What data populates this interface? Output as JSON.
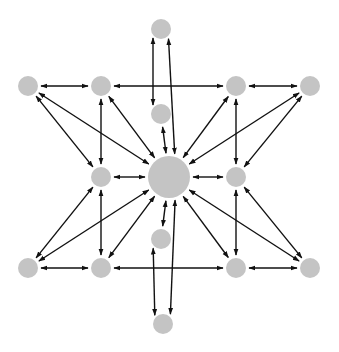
{
  "diagram": {
    "type": "network-star",
    "node_color": "#c4c4c4",
    "edge_color": "#111111",
    "background": "#ffffff",
    "nodes": [
      {
        "id": "center",
        "x": 169,
        "y": 177,
        "r": 21
      },
      {
        "id": "top",
        "x": 161,
        "y": 29,
        "r": 10
      },
      {
        "id": "upper-mid",
        "x": 161,
        "y": 114,
        "r": 10
      },
      {
        "id": "lower-mid",
        "x": 161,
        "y": 239,
        "r": 10
      },
      {
        "id": "bottom",
        "x": 163,
        "y": 324,
        "r": 10
      },
      {
        "id": "inner-top-left",
        "x": 101,
        "y": 86,
        "r": 10
      },
      {
        "id": "inner-mid-left",
        "x": 101,
        "y": 177,
        "r": 10
      },
      {
        "id": "inner-bottom-left",
        "x": 101,
        "y": 268,
        "r": 10
      },
      {
        "id": "inner-top-right",
        "x": 236,
        "y": 86,
        "r": 10
      },
      {
        "id": "inner-mid-right",
        "x": 236,
        "y": 177,
        "r": 10
      },
      {
        "id": "inner-bottom-right",
        "x": 236,
        "y": 268,
        "r": 10
      },
      {
        "id": "outer-top-left",
        "x": 28,
        "y": 86,
        "r": 10
      },
      {
        "id": "outer-bottom-left",
        "x": 28,
        "y": 268,
        "r": 10
      },
      {
        "id": "outer-top-right",
        "x": 310,
        "y": 86,
        "r": 10
      },
      {
        "id": "outer-bottom-right",
        "x": 310,
        "y": 268,
        "r": 10
      }
    ],
    "edges": [
      {
        "from": "outer-top-left",
        "to": "inner-top-left",
        "dir": "both"
      },
      {
        "from": "inner-top-left",
        "to": "inner-top-right",
        "dir": "both"
      },
      {
        "from": "inner-top-right",
        "to": "outer-top-right",
        "dir": "both"
      },
      {
        "from": "outer-bottom-left",
        "to": "inner-bottom-left",
        "dir": "both"
      },
      {
        "from": "inner-bottom-left",
        "to": "inner-bottom-right",
        "dir": "both"
      },
      {
        "from": "inner-bottom-right",
        "to": "outer-bottom-right",
        "dir": "both"
      },
      {
        "from": "inner-top-left",
        "to": "inner-mid-left",
        "dir": "both"
      },
      {
        "from": "inner-mid-left",
        "to": "inner-bottom-left",
        "dir": "both"
      },
      {
        "from": "inner-top-right",
        "to": "inner-mid-right",
        "dir": "both"
      },
      {
        "from": "inner-mid-right",
        "to": "inner-bottom-right",
        "dir": "both"
      },
      {
        "from": "inner-mid-left",
        "to": "center",
        "dir": "both"
      },
      {
        "from": "inner-mid-right",
        "to": "center",
        "dir": "both"
      },
      {
        "from": "top",
        "to": "upper-mid",
        "dir": "both",
        "offset": -8
      },
      {
        "from": "upper-mid",
        "to": "center",
        "dir": "both"
      },
      {
        "from": "center",
        "to": "lower-mid",
        "dir": "both"
      },
      {
        "from": "lower-mid",
        "to": "bottom",
        "dir": "both",
        "offset": -8
      },
      {
        "from": "top",
        "to": "center",
        "dir": "both",
        "offset": 7
      },
      {
        "from": "bottom",
        "to": "center",
        "dir": "both",
        "offset": 7
      },
      {
        "from": "center",
        "to": "inner-top-left",
        "dir": "both"
      },
      {
        "from": "center",
        "to": "inner-top-right",
        "dir": "both"
      },
      {
        "from": "center",
        "to": "inner-bottom-left",
        "dir": "both"
      },
      {
        "from": "center",
        "to": "inner-bottom-right",
        "dir": "both"
      },
      {
        "from": "center",
        "to": "outer-top-left",
        "dir": "both"
      },
      {
        "from": "center",
        "to": "outer-top-right",
        "dir": "both"
      },
      {
        "from": "center",
        "to": "outer-bottom-left",
        "dir": "both"
      },
      {
        "from": "center",
        "to": "outer-bottom-right",
        "dir": "both"
      },
      {
        "from": "outer-top-left",
        "to": "inner-mid-left",
        "dir": "both"
      },
      {
        "from": "outer-bottom-left",
        "to": "inner-mid-left",
        "dir": "both"
      },
      {
        "from": "outer-top-right",
        "to": "inner-mid-right",
        "dir": "both"
      },
      {
        "from": "outer-bottom-right",
        "to": "inner-mid-right",
        "dir": "both"
      }
    ]
  }
}
